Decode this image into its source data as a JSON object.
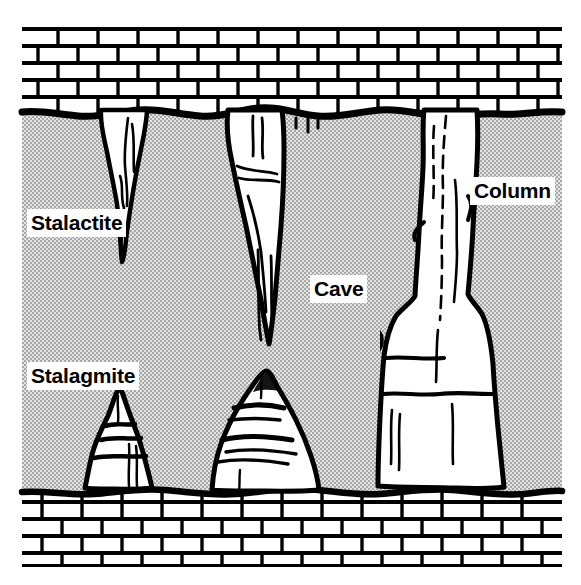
{
  "figure": {
    "kind": "geology-cross-section-diagram",
    "background_color": "#ffffff",
    "ink_color": "#000000",
    "cave_fill_color": "#c9c9c9",
    "rock_fill_color": "#ffffff",
    "formation_fill_color": "#ffffff"
  },
  "labels": [
    {
      "id": "stalactite",
      "text": "Stalactite",
      "x": 27,
      "y": 209,
      "points_to": "ceiling-hanging-formation"
    },
    {
      "id": "stalagmite",
      "text": "Stalagmite",
      "x": 27,
      "y": 362,
      "points_to": "floor-rising-formation"
    },
    {
      "id": "cave",
      "text": "Cave",
      "x": 310,
      "y": 275,
      "points_to": "open-void-chamber"
    },
    {
      "id": "column",
      "text": "Column",
      "x": 470,
      "y": 177,
      "points_to": "floor-to-ceiling-pillar"
    }
  ],
  "regions": {
    "ceiling_rock": {
      "name": "Limestone bedrock ceiling",
      "brick_rows": 5,
      "top": 27,
      "bottom": 112
    },
    "cave_void": {
      "name": "Cave chamber",
      "top": 112,
      "bottom": 492,
      "texture": "stipple"
    },
    "floor_rock": {
      "name": "Limestone bedrock floor",
      "brick_rows": 4,
      "top": 492,
      "bottom": 567
    },
    "drawing_bounds": {
      "left": 22,
      "right": 562,
      "top": 27,
      "bottom": 567
    }
  },
  "formations": [
    {
      "id": "stalactite-1",
      "type": "stalactite",
      "attached_to": "ceiling",
      "tip_x": 121,
      "tip_y": 262,
      "base_width": 38
    },
    {
      "id": "stalactite-2",
      "type": "stalactite",
      "attached_to": "ceiling",
      "tip_x": 270,
      "tip_y": 344,
      "base_width": 58
    },
    {
      "id": "column-1",
      "type": "column",
      "attached_to": "ceiling-and-floor",
      "top_y": 112,
      "bottom_y": 489,
      "shaft_width": 54,
      "base_width": 112
    },
    {
      "id": "stalagmite-1",
      "type": "stalagmite",
      "attached_to": "floor",
      "apex_x": 120,
      "apex_y": 390,
      "base_width": 76
    },
    {
      "id": "stalagmite-2",
      "type": "stalagmite",
      "attached_to": "floor",
      "apex_x": 266,
      "apex_y": 372,
      "base_width": 110
    }
  ]
}
